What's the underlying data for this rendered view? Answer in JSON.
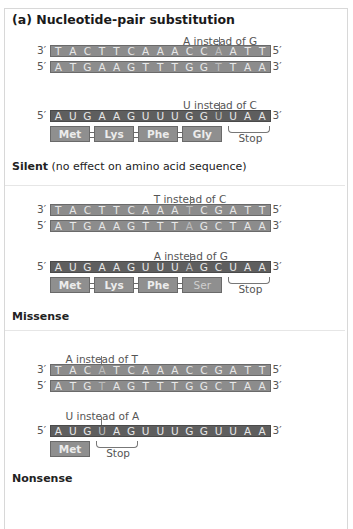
{
  "title": "(a) Nucleotide-pair substitution",
  "panels": [
    {
      "name": "silent",
      "template_note": "A instead of G",
      "template_strand": {
        "left_end": "3′",
        "right_end": "5′",
        "bases": [
          "T",
          "A",
          "C",
          "T",
          "T",
          "C",
          "A",
          "A",
          "A",
          "C",
          "C",
          "A",
          "A",
          "T",
          "T"
        ],
        "highlight": 11
      },
      "coding_strand": {
        "left_end": "5′",
        "right_end": "3′",
        "bases": [
          "A",
          "T",
          "G",
          "A",
          "A",
          "G",
          "T",
          "T",
          "T",
          "G",
          "G",
          "T",
          "T",
          "A",
          "A"
        ],
        "highlight": 11
      },
      "mrna_note": "U instead of C",
      "mrna": {
        "left_end": "5′",
        "right_end": "3′",
        "bases": [
          "A",
          "U",
          "G",
          "A",
          "A",
          "G",
          "U",
          "U",
          "U",
          "G",
          "G",
          "U",
          "U",
          "A",
          "A"
        ],
        "highlight": 11
      },
      "amino_acids": [
        "Met",
        "Lys",
        "Phe",
        "Gly"
      ],
      "stop_label": "Stop",
      "result_label": "Silent",
      "result_desc": " (no effect on amino acid sequence)"
    },
    {
      "name": "missense",
      "template_note": "T instead of C",
      "template_strand": {
        "left_end": "3′",
        "right_end": "5′",
        "bases": [
          "T",
          "A",
          "C",
          "T",
          "T",
          "C",
          "A",
          "A",
          "A",
          "T",
          "C",
          "G",
          "A",
          "T",
          "T"
        ],
        "highlight": 9
      },
      "coding_strand": {
        "left_end": "5′",
        "right_end": "3′",
        "bases": [
          "A",
          "T",
          "G",
          "A",
          "A",
          "G",
          "T",
          "T",
          "T",
          "A",
          "G",
          "C",
          "T",
          "A",
          "A"
        ],
        "highlight": 9
      },
      "mrna_note": "A instead of G",
      "mrna": {
        "left_end": "5′",
        "right_end": "3′",
        "bases": [
          "A",
          "U",
          "G",
          "A",
          "A",
          "G",
          "U",
          "U",
          "U",
          "A",
          "G",
          "C",
          "U",
          "A",
          "A"
        ],
        "highlight": 9
      },
      "amino_acids": [
        "Met",
        "Lys",
        "Phe",
        "Ser"
      ],
      "stop_label": "Stop",
      "result_label": "Missense",
      "result_desc": ""
    },
    {
      "name": "nonsense",
      "template_note": "A instead of T",
      "template_strand": {
        "left_end": "3′",
        "right_end": "5′",
        "bases": [
          "T",
          "A",
          "C",
          "A",
          "T",
          "C",
          "A",
          "A",
          "A",
          "C",
          "C",
          "G",
          "A",
          "T",
          "T"
        ],
        "highlight": 3
      },
      "coding_strand": {
        "left_end": "5′",
        "right_end": "3′",
        "bases": [
          "A",
          "T",
          "G",
          "T",
          "A",
          "G",
          "T",
          "T",
          "T",
          "G",
          "G",
          "C",
          "T",
          "A",
          "A"
        ],
        "highlight": 3
      },
      "mrna_note": "U instead of A",
      "mrna": {
        "left_end": "5′",
        "right_end": "3′",
        "bases": [
          "A",
          "U",
          "G",
          "U",
          "A",
          "G",
          "U",
          "U",
          "U",
          "G",
          "G",
          "U",
          "U",
          "A",
          "A"
        ],
        "highlight": 3
      },
      "amino_acids": [
        "Met"
      ],
      "stop_label": "Stop",
      "result_label": "Nonsense",
      "result_desc": ""
    }
  ]
}
